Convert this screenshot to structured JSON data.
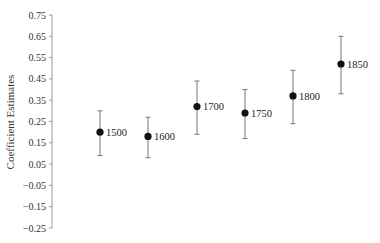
{
  "chart_data": {
    "type": "scatter",
    "subtype": "point-estimate-with-error-bars",
    "title": "",
    "xlabel": "",
    "ylabel": "Coefficient Estimates",
    "ylim": [
      -0.25,
      0.75
    ],
    "yticks": [
      0.75,
      0.65,
      0.55,
      0.45,
      0.35,
      0.25,
      0.15,
      0.05,
      -0.05,
      -0.15,
      -0.25
    ],
    "ytick_labels": [
      "0.75",
      "0.65",
      "0.55",
      "0.45",
      "0.35",
      "0.25",
      "0.15",
      "0.05",
      "−0.05",
      "−0.15",
      "−0.25"
    ],
    "grid": false,
    "legend": null,
    "categories": [
      "1500",
      "1600",
      "1700",
      "1750",
      "1800",
      "1850"
    ],
    "values": [
      0.2,
      0.18,
      0.32,
      0.29,
      0.37,
      0.52
    ],
    "lower": [
      0.09,
      0.08,
      0.19,
      0.17,
      0.24,
      0.38
    ],
    "upper": [
      0.3,
      0.27,
      0.44,
      0.4,
      0.49,
      0.65
    ],
    "colors": {
      "point": "#111111",
      "errorbar": "#777777",
      "axis": "#999999"
    }
  }
}
